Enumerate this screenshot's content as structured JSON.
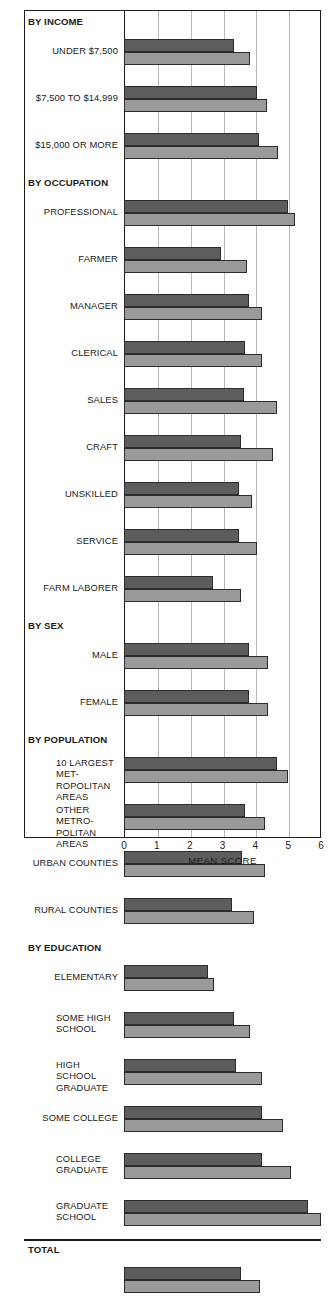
{
  "chart_data": {
    "type": "bar",
    "orientation": "horizontal",
    "title": "",
    "xlabel": "MEAN SCORE",
    "ylabel": "",
    "xlim": [
      0,
      6
    ],
    "xticks": [
      "0",
      "1",
      "2",
      "3",
      "4",
      "5",
      "6"
    ],
    "grid": true,
    "legend": [],
    "series": [
      {
        "name": "dark",
        "color": "#5d5d5d"
      },
      {
        "name": "light",
        "color": "#9a9a9a"
      }
    ],
    "groups": [
      {
        "kind": "header",
        "label": "BY INCOME"
      },
      {
        "kind": "bars",
        "label": "UNDER $7,500",
        "align": "right",
        "dark": 3.35,
        "light": 3.85
      },
      {
        "kind": "bars",
        "label": "$7,500 TO $14,999",
        "align": "right",
        "dark": 4.05,
        "light": 4.35
      },
      {
        "kind": "bars",
        "label": "$15,000 OR MORE",
        "align": "right",
        "dark": 4.1,
        "light": 4.7
      },
      {
        "kind": "header",
        "label": "BY OCCUPATION"
      },
      {
        "kind": "bars",
        "label": "PROFESSIONAL",
        "align": "right",
        "dark": 5.0,
        "light": 5.2
      },
      {
        "kind": "bars",
        "label": "FARMER",
        "align": "right",
        "dark": 2.95,
        "light": 3.75
      },
      {
        "kind": "bars",
        "label": "MANAGER",
        "align": "right",
        "dark": 3.8,
        "light": 4.2
      },
      {
        "kind": "bars",
        "label": "CLERICAL",
        "align": "right",
        "dark": 3.7,
        "light": 4.2
      },
      {
        "kind": "bars",
        "label": "SALES",
        "align": "right",
        "dark": 3.65,
        "light": 4.65
      },
      {
        "kind": "bars",
        "label": "CRAFT",
        "align": "right",
        "dark": 3.55,
        "light": 4.55
      },
      {
        "kind": "bars",
        "label": "UNSKILLED",
        "align": "right",
        "dark": 3.5,
        "light": 3.9
      },
      {
        "kind": "bars",
        "label": "SERVICE",
        "align": "right",
        "dark": 3.5,
        "light": 4.05
      },
      {
        "kind": "bars",
        "label": "FARM LABORER",
        "align": "right",
        "dark": 2.7,
        "light": 3.55
      },
      {
        "kind": "header",
        "label": "BY SEX"
      },
      {
        "kind": "bars",
        "label": "MALE",
        "align": "right",
        "dark": 3.8,
        "light": 4.4
      },
      {
        "kind": "bars",
        "label": "FEMALE",
        "align": "right",
        "dark": 3.8,
        "light": 4.4
      },
      {
        "kind": "header",
        "label": "BY POPULATION"
      },
      {
        "kind": "bars",
        "label": "10 LARGEST MET-\nROPOLITAN AREAS",
        "align": "left",
        "dark": 4.65,
        "light": 5.0
      },
      {
        "kind": "bars",
        "label": "OTHER METRO-\nPOLITAN AREAS",
        "align": "left",
        "dark": 3.7,
        "light": 4.3
      },
      {
        "kind": "bars",
        "label": "URBAN COUNTIES",
        "align": "right",
        "dark": 3.6,
        "light": 4.3
      },
      {
        "kind": "bars",
        "label": "RURAL COUNTIES",
        "align": "right",
        "dark": 3.3,
        "light": 3.95
      },
      {
        "kind": "header",
        "label": "BY EDUCATION"
      },
      {
        "kind": "bars",
        "label": "ELEMENTARY",
        "align": "right",
        "dark": 2.55,
        "light": 2.75
      },
      {
        "kind": "bars",
        "label": "SOME HIGH\nSCHOOL",
        "align": "left",
        "dark": 3.35,
        "light": 3.85
      },
      {
        "kind": "bars",
        "label": "HIGH SCHOOL\nGRADUATE",
        "align": "left",
        "dark": 3.4,
        "light": 4.2
      },
      {
        "kind": "bars",
        "label": "SOME COLLEGE",
        "align": "right",
        "dark": 4.2,
        "light": 4.85
      },
      {
        "kind": "bars",
        "label": "COLLEGE\nGRADUATE",
        "align": "left",
        "dark": 4.2,
        "light": 5.1
      },
      {
        "kind": "bars",
        "label": "GRADUATE\nSCHOOL",
        "align": "left",
        "dark": 5.6,
        "light": 6.0
      },
      {
        "kind": "header",
        "label": "TOTAL",
        "divider": true
      },
      {
        "kind": "bars",
        "label": "",
        "align": "right",
        "dark": 3.55,
        "light": 4.15
      }
    ]
  }
}
